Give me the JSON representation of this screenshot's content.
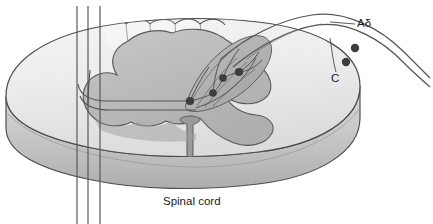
{
  "figure": {
    "background_color": "#ffffff"
  },
  "labels": {
    "a_delta": "Aδ",
    "c_fiber": "C",
    "spinal_cord": "Spinal cord"
  },
  "colors": {
    "outline": "#4c4c4c",
    "white_matter": "#e9e9e9",
    "white_matter_top": "#f2f2f2",
    "gray_matter": "#bfbfbf",
    "gray_matter_shadow": "#a8a8a8",
    "rim_side": "#cfcfcf",
    "rim_shadow": "#b3b3b3",
    "dorsal_horn_fill": "#b0b0b0",
    "fiber_line": "#545454",
    "synapse_dot": "#3d3d3d",
    "label_text": "#1b1b1b"
  },
  "anatomy": {
    "structures": [
      {
        "name": "white-matter",
        "description": "Outer pale oval region of the cord disc"
      },
      {
        "name": "gray-matter",
        "description": "Central butterfly-shaped darker region"
      },
      {
        "name": "dorsal-horn",
        "description": "Upper right horn where afferents synapse"
      },
      {
        "name": "ventral-median-fissure",
        "description": "Midline cleft at the bottom center"
      },
      {
        "name": "dorsal-columns",
        "description": "Scalloped lobes along the dorsal surface"
      },
      {
        "name": "cord-rim",
        "description": "3D extruded side face of the cord disc"
      }
    ],
    "ascending_tract_fibers": {
      "count": 3,
      "x_positions": [
        77,
        88,
        100
      ],
      "description": "Vertical ascending spinothalamic tract fibers"
    },
    "afferent_fibers": [
      {
        "name": "a-delta-fiber",
        "label": "Aδ",
        "description": "Thinly myelinated fast nociceptive afferent entering the dorsal horn"
      },
      {
        "name": "c-fiber",
        "label": "C",
        "description": "Unmyelinated slow nociceptive afferent entering the dorsal horn"
      }
    ],
    "synapses": {
      "count_in_dorsal_horn": 4,
      "positions": [
        {
          "x": 190,
          "y": 101
        },
        {
          "x": 213,
          "y": 93
        },
        {
          "x": 223,
          "y": 78
        },
        {
          "x": 239,
          "y": 72
        }
      ]
    },
    "peripheral_nodes": {
      "count": 2,
      "positions": [
        {
          "x": 355,
          "y": 48
        },
        {
          "x": 346,
          "y": 62
        }
      ],
      "description": "Dots marking the Aδ and C peripheral nerve fibers"
    }
  }
}
